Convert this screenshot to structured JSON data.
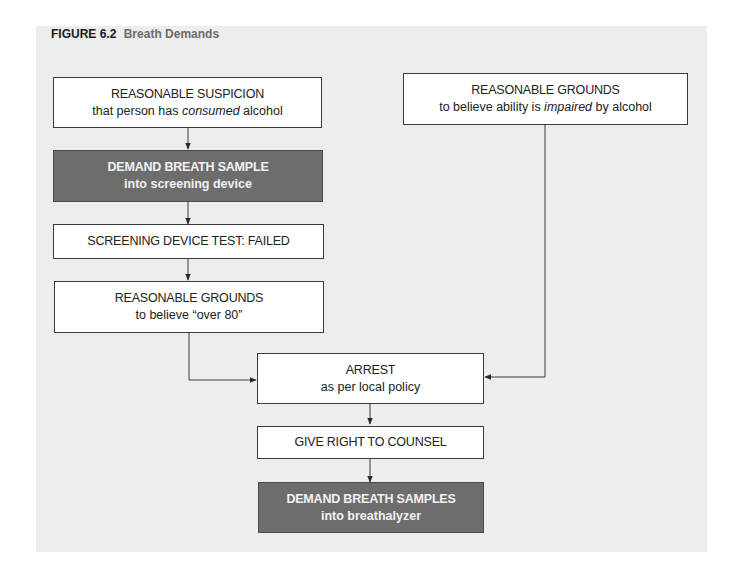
{
  "figure": {
    "number": "FIGURE 6.2",
    "title": "Breath Demands"
  },
  "colors": {
    "panel_bg": "#ededed",
    "box_bg": "#ffffff",
    "box_dark_bg": "#6d6d6d",
    "border": "#3a3a3a",
    "title_accent": "#6b6b6b"
  },
  "nodes": {
    "suspicion": {
      "line1": "REASONABLE SUSPICION",
      "line2_pre": "that person has ",
      "line2_em": "consumed",
      "line2_post": " alcohol"
    },
    "impaired": {
      "line1": "REASONABLE GROUNDS",
      "line2_pre": "to believe ability is ",
      "line2_em": "impaired",
      "line2_post": " by alcohol"
    },
    "screening_demand": {
      "line1": "DEMAND BREATH SAMPLE",
      "line2": "into screening device",
      "style": "dark"
    },
    "screening_failed": {
      "line1": "SCREENING DEVICE TEST: FAILED"
    },
    "over80": {
      "line1": "REASONABLE GROUNDS",
      "line2": "to believe “over 80”"
    },
    "arrest": {
      "line1": "ARREST",
      "line2": "as per local policy"
    },
    "counsel": {
      "line1": "GIVE RIGHT TO COUNSEL"
    },
    "breathalyzer_demand": {
      "line1": "DEMAND BREATH SAMPLES",
      "line2": "into breathalyzer",
      "style": "dark"
    }
  },
  "edges": [
    {
      "from": "suspicion",
      "to": "screening_demand"
    },
    {
      "from": "screening_demand",
      "to": "screening_failed"
    },
    {
      "from": "screening_failed",
      "to": "over80"
    },
    {
      "from": "over80",
      "to": "arrest"
    },
    {
      "from": "impaired",
      "to": "arrest"
    },
    {
      "from": "arrest",
      "to": "counsel"
    },
    {
      "from": "counsel",
      "to": "breathalyzer_demand"
    }
  ]
}
